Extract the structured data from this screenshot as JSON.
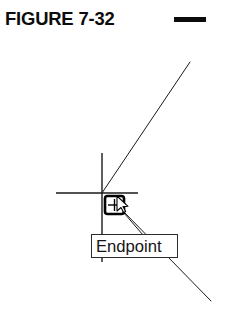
{
  "caption": {
    "title": "FIGURE 7-32",
    "rule": "caption-dash"
  },
  "drawing": {
    "type": "cad-osnap-illustration",
    "background": "#ffffff",
    "line_color": "#1a1a1a",
    "marker_color": "#000000",
    "crosshair": {
      "center_x": 102,
      "center_y": 193,
      "horizontal_x1": 56,
      "horizontal_x2": 138,
      "vertical_y1": 153,
      "vertical_y2": 262
    },
    "geometry_lines": [
      {
        "name": "upper-diagonal",
        "x1": 102,
        "y1": 193,
        "x2": 190,
        "y2": 62
      },
      {
        "name": "lower-diagonal",
        "x1": 124,
        "y1": 212,
        "x2": 211,
        "y2": 301
      }
    ],
    "snap_marker": {
      "name": "endpoint-snap-marker",
      "shape": "square",
      "x": 104,
      "y": 195,
      "width": 21,
      "height": 20,
      "glyph": "plus"
    },
    "cursor": {
      "name": "mouse-arrow",
      "x": 117,
      "y": 196
    },
    "leader": {
      "x1": 124,
      "y1": 213,
      "x2": 143,
      "y2": 235
    }
  },
  "tooltip": {
    "label": "Endpoint"
  }
}
